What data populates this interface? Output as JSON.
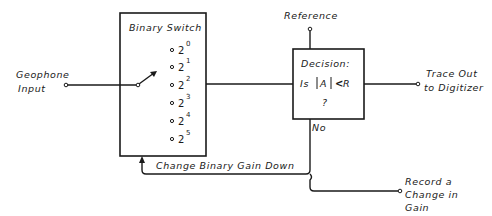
{
  "diagram": {
    "type": "block-diagram",
    "inputs": {
      "geophone": {
        "line1": "Geophone",
        "line2": "Input"
      },
      "reference": "Reference"
    },
    "binary_switch": {
      "title": "Binary Switch",
      "positions": [
        {
          "base": "2",
          "exp": "0"
        },
        {
          "base": "2",
          "exp": "1"
        },
        {
          "base": "2",
          "exp": "2"
        },
        {
          "base": "2",
          "exp": "3"
        },
        {
          "base": "2",
          "exp": "4"
        },
        {
          "base": "2",
          "exp": "5"
        }
      ]
    },
    "decision": {
      "title": "Decision:",
      "question_prefix": "Is",
      "abs_var": "A",
      "operator": "<",
      "ref_var": "R",
      "question_mark": "?",
      "no_label": "No"
    },
    "outputs": {
      "trace": {
        "line1": "Trace Out",
        "line2": "to Digitizer"
      },
      "record": {
        "line1": "Record a",
        "line2": "Change in",
        "line3": "Gain"
      }
    },
    "feedback_label": "Change Binary Gain Down",
    "colors": {
      "stroke": "#1a1a1a",
      "background": "#ffffff"
    }
  }
}
